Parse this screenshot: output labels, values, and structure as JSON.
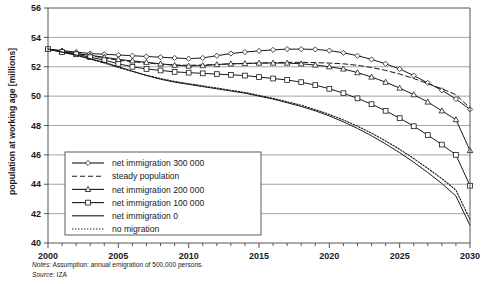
{
  "chart_data": {
    "type": "line",
    "title": "",
    "xlabel": "",
    "ylabel": "population at working age [millions]",
    "xlim": [
      2000,
      2030
    ],
    "ylim": [
      40,
      56
    ],
    "ytick_step": 2,
    "xtick_step": 5,
    "x_minor_step": 1,
    "grid": "horizontal",
    "legend_position": "inside-lower-left",
    "xticks": [
      "2000",
      "2005",
      "2010",
      "2015",
      "2020",
      "2025",
      "2030"
    ],
    "yticks": [
      "40",
      "42",
      "44",
      "46",
      "48",
      "50",
      "52",
      "54",
      "56"
    ],
    "x": [
      2000,
      2001,
      2002,
      2003,
      2004,
      2005,
      2006,
      2007,
      2008,
      2009,
      2010,
      2011,
      2012,
      2013,
      2014,
      2015,
      2016,
      2017,
      2018,
      2019,
      2020,
      2021,
      2022,
      2023,
      2024,
      2025,
      2026,
      2027,
      2028,
      2029,
      2030
    ],
    "series": [
      {
        "name": "net immigration 300 000",
        "marker": "diamond",
        "style": "solid",
        "values": [
          53.2,
          53.1,
          53.0,
          52.9,
          52.85,
          52.8,
          52.75,
          52.7,
          52.65,
          52.6,
          52.55,
          52.6,
          52.75,
          52.9,
          53.0,
          53.08,
          53.15,
          53.2,
          53.2,
          53.18,
          53.1,
          52.95,
          52.75,
          52.5,
          52.2,
          51.85,
          51.4,
          50.9,
          50.4,
          49.8,
          49.1
        ]
      },
      {
        "name": "steady population",
        "marker": "none",
        "style": "dashed",
        "values": [
          53.2,
          53.05,
          52.9,
          52.75,
          52.6,
          52.45,
          52.35,
          52.25,
          52.18,
          52.12,
          52.1,
          52.12,
          52.15,
          52.2,
          52.22,
          52.25,
          52.28,
          52.3,
          52.3,
          52.28,
          52.25,
          52.2,
          52.1,
          51.95,
          51.75,
          51.5,
          51.2,
          50.85,
          50.5,
          50.1,
          49.2
        ]
      },
      {
        "name": "net immigration 200 000",
        "marker": "triangle",
        "style": "solid",
        "values": [
          53.2,
          53.05,
          52.9,
          52.78,
          52.65,
          52.5,
          52.4,
          52.3,
          52.2,
          52.1,
          52.05,
          52.08,
          52.15,
          52.2,
          52.22,
          52.25,
          52.25,
          52.25,
          52.2,
          52.12,
          52.0,
          51.85,
          51.6,
          51.3,
          50.95,
          50.55,
          50.1,
          49.6,
          49.0,
          48.4,
          46.3
        ]
      },
      {
        "name": "net immigration 100 000",
        "marker": "square",
        "style": "solid",
        "values": [
          53.2,
          53.0,
          52.85,
          52.65,
          52.45,
          52.2,
          52.0,
          51.85,
          51.75,
          51.65,
          51.6,
          51.55,
          51.5,
          51.45,
          51.4,
          51.3,
          51.2,
          51.1,
          50.95,
          50.75,
          50.5,
          50.2,
          49.85,
          49.45,
          49.0,
          48.5,
          47.95,
          47.35,
          46.7,
          46.0,
          43.9
        ]
      },
      {
        "name": "net immigration 0",
        "marker": "none",
        "style": "solid",
        "values": [
          53.2,
          53.0,
          52.8,
          52.55,
          52.3,
          52.0,
          51.7,
          51.4,
          51.15,
          50.95,
          50.8,
          50.65,
          50.5,
          50.35,
          50.2,
          50.0,
          49.8,
          49.55,
          49.3,
          49.0,
          48.65,
          48.25,
          47.8,
          47.3,
          46.75,
          46.15,
          45.5,
          44.8,
          44.05,
          43.2,
          41.2
        ]
      },
      {
        "name": "no migration",
        "marker": "none",
        "style": "dotted",
        "values": [
          53.2,
          53.0,
          52.78,
          52.52,
          52.25,
          51.95,
          51.68,
          51.42,
          51.2,
          51.0,
          50.85,
          50.7,
          50.55,
          50.4,
          50.25,
          50.05,
          49.85,
          49.62,
          49.38,
          49.08,
          48.75,
          48.38,
          47.95,
          47.48,
          46.95,
          46.38,
          45.75,
          45.08,
          44.38,
          43.6,
          41.6
        ]
      }
    ]
  },
  "legend": {
    "items": [
      {
        "label": "net immigration 300 000"
      },
      {
        "label": "steady population"
      },
      {
        "label": "net immigration 200 000"
      },
      {
        "label": "net immigration 100 000"
      },
      {
        "label": "net immigration 0"
      },
      {
        "label": "no migration"
      }
    ]
  },
  "notes": {
    "label": "Notes:",
    "text": " Assumption: annual emigration of 500,000 persons.",
    "source_label": "Source:",
    "source_text": " IZA"
  },
  "colors": {
    "line": "#1a1a1a",
    "grid": "#9a9a9a",
    "axis": "#555555",
    "background": "#ffffff"
  }
}
